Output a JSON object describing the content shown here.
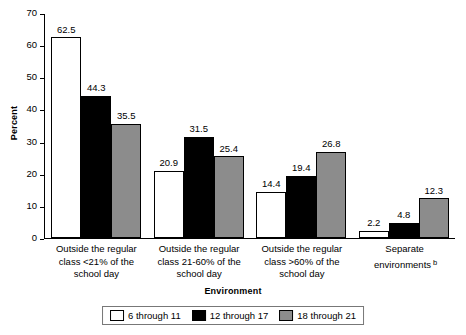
{
  "chart_data": {
    "type": "bar",
    "title": "",
    "xlabel": "Environment",
    "ylabel": "Percent",
    "ylim": [
      0,
      70
    ],
    "ytick_labels": [
      "70",
      "60",
      "50",
      "40",
      "30",
      "20",
      "10",
      "0"
    ],
    "ytick_values": [
      70,
      60,
      50,
      40,
      30,
      20,
      10,
      0
    ],
    "grid": false,
    "legend_position": "bottom-center",
    "categories": [
      "Outside the regular class <21% of the school day",
      "Outside the regular class 21-60% of the school day",
      "Outside the regular class >60% of the school day",
      "Separate environments"
    ],
    "category_lines": [
      [
        "Outside the regular",
        "class <21% of the",
        "school day"
      ],
      [
        "Outside the regular",
        "class 21-60% of the",
        "school day"
      ],
      [
        "Outside the regular",
        "class >60% of the",
        "school day"
      ],
      [
        "Separate",
        "environments"
      ]
    ],
    "category_footnotes": [
      "",
      "",
      "",
      "b"
    ],
    "series": [
      {
        "name": "6 through 11",
        "fill": "dotted",
        "color": "#ffffff",
        "values": [
          62.5,
          20.9,
          14.4,
          2.2
        ]
      },
      {
        "name": "12 through 17",
        "fill": "solid",
        "color": "#000000",
        "values": [
          44.3,
          31.5,
          19.4,
          4.8
        ]
      },
      {
        "name": "18 through 21",
        "fill": "solid",
        "color": "#8c8c8c",
        "values": [
          35.5,
          25.4,
          26.8,
          12.3
        ]
      }
    ]
  }
}
